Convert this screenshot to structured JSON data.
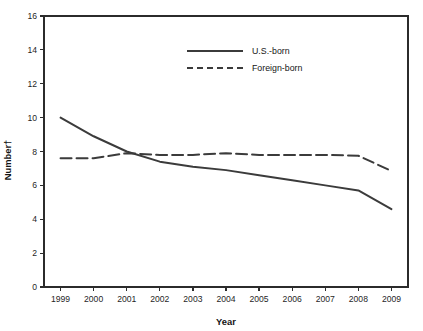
{
  "chart_data": {
    "type": "line",
    "title": "",
    "xlabel": "Year",
    "ylabel": "Number†",
    "categories": [
      "1999",
      "2000",
      "2001",
      "2002",
      "2003",
      "2004",
      "2005",
      "2006",
      "2007",
      "2008",
      "2009"
    ],
    "x": [
      1999,
      2000,
      2001,
      2002,
      2003,
      2004,
      2005,
      2006,
      2007,
      2008,
      2009
    ],
    "xlim": [
      1998.5,
      2009.5
    ],
    "ylim": [
      0,
      16
    ],
    "yticks": [
      0,
      2,
      4,
      6,
      8,
      10,
      12,
      14,
      16
    ],
    "ytick_labels": [
      "0",
      "2",
      "4",
      "6",
      "8",
      "10",
      "12",
      "14",
      "16"
    ],
    "grid": false,
    "legend_position": "top-center",
    "series": [
      {
        "name": "U.S.-born",
        "style": "solid",
        "color": "#3b3b3b",
        "values": [
          10.0,
          8.9,
          8.0,
          7.4,
          7.1,
          6.9,
          6.6,
          6.3,
          6.0,
          5.7,
          4.6
        ]
      },
      {
        "name": "Foreign-born",
        "style": "dashed",
        "color": "#3b3b3b",
        "values": [
          7.6,
          7.6,
          7.9,
          7.8,
          7.8,
          7.9,
          7.8,
          7.8,
          7.8,
          7.75,
          6.85
        ]
      }
    ]
  },
  "legend": {
    "items": [
      {
        "label": "U.S.-born",
        "style": "solid"
      },
      {
        "label": "Foreign-born",
        "style": "dashed"
      }
    ]
  },
  "axes": {
    "x_title": "Year",
    "y_title": "Number†"
  }
}
